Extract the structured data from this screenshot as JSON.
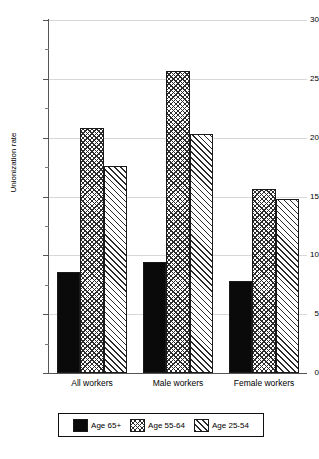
{
  "chart_data": {
    "type": "bar",
    "title": "",
    "subtitle": "",
    "xlabel": "",
    "ylabel": "Unionization rate",
    "ylim": [
      0,
      30
    ],
    "ytick_step": 5,
    "yticks": [
      0,
      5,
      10,
      15,
      20,
      25,
      30
    ],
    "ytick_labels": [
      "0",
      "5",
      "10",
      "15",
      "20",
      "25",
      "30"
    ],
    "yticks_minor": [
      2.5,
      7.5,
      12.5,
      17.5,
      22.5,
      27.5
    ],
    "grid": "horizontal-major-faint",
    "legend_position": "bottom-outside",
    "categories": [
      "All workers",
      "Male workers",
      "Female workers"
    ],
    "series": [
      {
        "name": "Age 65+",
        "pattern": "solid-black",
        "values": [
          8.6,
          9.4,
          7.8
        ]
      },
      {
        "name": "Age 55-64",
        "pattern": "crosshatch",
        "values": [
          20.8,
          25.7,
          15.6
        ]
      },
      {
        "name": "Age 25-54",
        "pattern": "diagonal",
        "values": [
          17.6,
          20.3,
          14.8
        ]
      }
    ]
  },
  "axis": {
    "y_title": "Unionization rate"
  },
  "legend": {
    "entries": [
      {
        "label": "Age 65+"
      },
      {
        "label": "Age 55-64"
      },
      {
        "label": "Age 25-54"
      }
    ]
  },
  "colors": {
    "background": "#ffffff",
    "ink": "#000000",
    "axis": "#555555",
    "gridline": "#d8d8d8",
    "bar_solid": "#0a0a0a",
    "bar_hatch": "#2b2b2b",
    "bar_fill": "#ffffff"
  }
}
